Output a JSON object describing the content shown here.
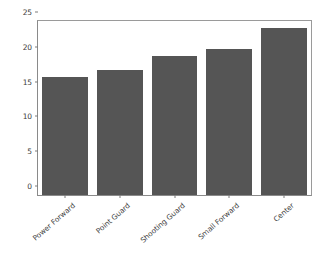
{
  "chart_data": {
    "type": "bar",
    "title": "",
    "xlabel": "",
    "ylabel": "",
    "categories": [
      "Power Forward",
      "Point Guard",
      "Shooting Guard",
      "Small Forward",
      "Center"
    ],
    "values": [
      17,
      18,
      20,
      21,
      24
    ],
    "ylim": [
      0,
      25
    ],
    "yticks": [
      0,
      5,
      10,
      15,
      20,
      25
    ],
    "ytick_labels": [
      "0",
      "5",
      "10",
      "15",
      "20",
      "25"
    ],
    "grid": false,
    "legend": null,
    "bar_color": "#555555",
    "background_color": "#ffffff",
    "axis_color": "#8a8a8a",
    "tick_label_color": "#3b3b3b",
    "xtick_rotation": -41
  }
}
